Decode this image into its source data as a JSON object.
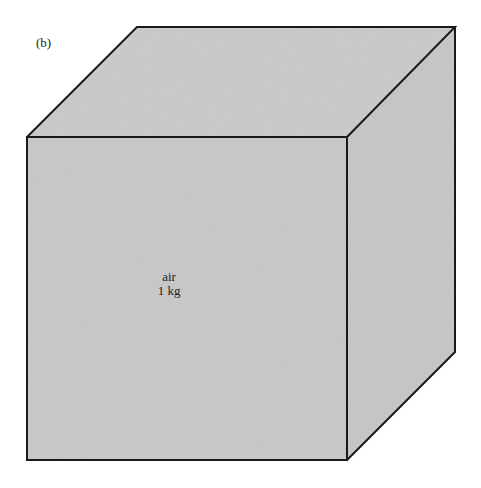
{
  "figure": {
    "panel_label": "(b)",
    "cube": {
      "contents_label": "air",
      "mass_label": "1 kg",
      "face_color": "#c8c8c8",
      "edge_color": "#1a1a1a"
    }
  }
}
